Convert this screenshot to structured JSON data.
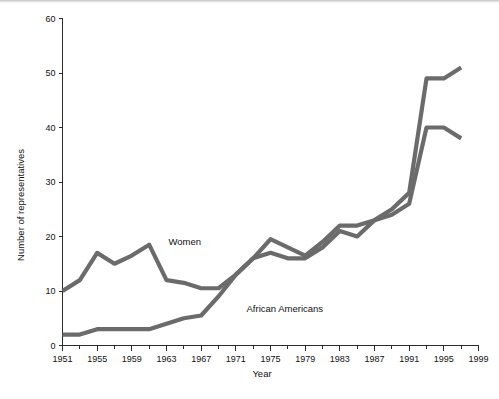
{
  "figure": {
    "background_color": "#ffffff",
    "line_color": "#6b6b6b",
    "axis_color": "#2b2b2b",
    "text_color": "#111111"
  },
  "axes": {
    "y_title": "Number of representatives",
    "x_title": "Year",
    "y_ticks": [
      "0",
      "10",
      "20",
      "30",
      "40",
      "50",
      "60"
    ],
    "x_ticks": [
      "1951",
      "1955",
      "1959",
      "1963",
      "1967",
      "1971",
      "1975",
      "1979",
      "1983",
      "1987",
      "1991",
      "1995",
      "1999"
    ]
  },
  "series_labels": {
    "women": "Women",
    "african_americans": "African Americans"
  },
  "chart_data": {
    "type": "line",
    "title": "",
    "xlabel": "Year",
    "ylabel": "Number of representatives",
    "xlim": [
      1951,
      1999
    ],
    "ylim": [
      0,
      60
    ],
    "grid": false,
    "legend": "inline-annotations",
    "x": [
      1951,
      1953,
      1955,
      1957,
      1959,
      1961,
      1963,
      1965,
      1967,
      1969,
      1971,
      1973,
      1975,
      1977,
      1979,
      1981,
      1983,
      1985,
      1987,
      1989,
      1991,
      1993,
      1995,
      1997
    ],
    "series": [
      {
        "name": "Women",
        "color": "#6b6b6b",
        "label_x": 1963,
        "label_y": 18,
        "values": [
          10,
          12,
          17,
          15,
          16.5,
          18.5,
          12,
          11.5,
          10.5,
          10.5,
          13,
          16,
          19.5,
          18,
          16.5,
          19,
          22,
          22,
          23,
          25,
          28,
          49,
          49,
          51
        ]
      },
      {
        "name": "African Americans",
        "color": "#6b6b6b",
        "label_x": 1972,
        "label_y": 6.5,
        "values": [
          2,
          2,
          3,
          3,
          3,
          3,
          4,
          5,
          5.5,
          9,
          13,
          16,
          17,
          16,
          16,
          18,
          21,
          20,
          23,
          24,
          26,
          40,
          40,
          38
        ]
      }
    ]
  }
}
